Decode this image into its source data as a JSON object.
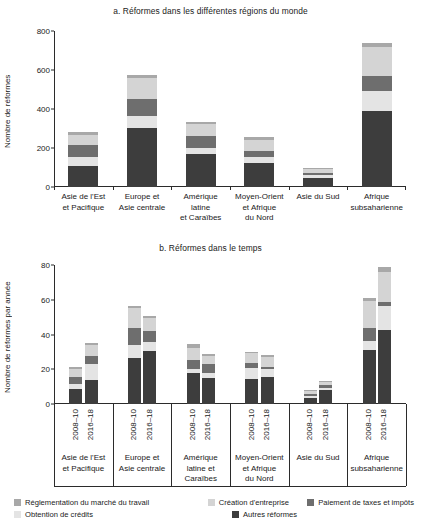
{
  "figure": {
    "panel_a_title": "a. Réformes dans les différentes régions du monde",
    "panel_b_title": "b. Réformes dans le temps",
    "ylabel_a": "Nombre de réformes",
    "ylabel_b": "Nombre de réformes par année"
  },
  "legend": {
    "items": [
      {
        "label": "Réglementation du marché du travail",
        "color": "#a8a8a8"
      },
      {
        "label": "Création d'entreprise",
        "color": "#d4d4d4"
      },
      {
        "label": "Paiement de taxes et impôts",
        "color": "#6e6e6e"
      },
      {
        "label": "Obtention de crédits",
        "color": "#e4e4e4"
      },
      {
        "label": "Autres réformes",
        "color": "#3d3d3d"
      }
    ]
  },
  "chart_data": [
    {
      "type": "bar",
      "id": "panel-a",
      "title": "a. Réformes dans les différentes régions du monde",
      "xlabel": "",
      "ylabel": "Nombre de réformes",
      "ylim": [
        0,
        800
      ],
      "yticks": [
        0,
        200,
        400,
        600,
        800
      ],
      "grid": false,
      "stacked": true,
      "legend_position": "bottom",
      "categories": [
        "Asie de l'Est\net Pacifique",
        "Europe et\nAsie centrale",
        "Amérique\nlatine\net Caraïbes",
        "Moyen-Orient\net Afrique\ndu Nord",
        "Asie du Sud",
        "Afrique\nsubsaharienne"
      ],
      "series": [
        {
          "name": "Autres réformes",
          "color": "#3d3d3d",
          "values": [
            110,
            305,
            167,
            122,
            48,
            390
          ]
        },
        {
          "name": "Obtention de crédits",
          "color": "#e4e4e4",
          "values": [
            45,
            60,
            35,
            32,
            12,
            103
          ]
        },
        {
          "name": "Paiement de taxes et impôts",
          "color": "#6e6e6e",
          "values": [
            63,
            87,
            58,
            30,
            11,
            77
          ]
        },
        {
          "name": "Création d'entreprise",
          "color": "#d4d4d4",
          "values": [
            48,
            106,
            62,
            57,
            20,
            147
          ]
        },
        {
          "name": "Réglementation du marché du travail",
          "color": "#a8a8a8",
          "values": [
            14,
            15,
            11,
            14,
            8,
            23
          ]
        }
      ],
      "totals": [
        280,
        573,
        333,
        255,
        99,
        740
      ]
    },
    {
      "type": "bar",
      "id": "panel-b",
      "title": "b. Réformes dans le temps",
      "xlabel": "",
      "ylabel": "Nombre de réformes par année",
      "ylim": [
        0,
        80
      ],
      "yticks": [
        0,
        20,
        40,
        60,
        80
      ],
      "grid": false,
      "stacked": true,
      "legend_position": "bottom",
      "groups": [
        "Asie de l'Est\net Pacifique",
        "Europe et\nAsie centrale",
        "Amérique\nlatine et\nCaraïbes",
        "Moyen-Orient\net Afrique\ndu Nord",
        "Asie du Sud",
        "Afrique\nsubsaharienne"
      ],
      "periods": [
        "2008–10",
        "2016–18"
      ],
      "categories": [
        "2008–10",
        "2016–18",
        "2008–10",
        "2016–18",
        "2008–10",
        "2016–18",
        "2008–10",
        "2016–18",
        "2008–10",
        "2016–18",
        "2008–10",
        "2016–18"
      ],
      "series": [
        {
          "name": "Autres réformes",
          "color": "#3d3d3d",
          "values": [
            8.5,
            14.0,
            26.3,
            30.8,
            18.0,
            15.0,
            14.5,
            15.8,
            3.2,
            7.8,
            31.0,
            42.7
          ]
        },
        {
          "name": "Obtention de crédits",
          "color": "#e4e4e4",
          "values": [
            3.0,
            8.8,
            7.8,
            4.8,
            2.0,
            3.0,
            6.0,
            4.5,
            1.4,
            1.7,
            5.0,
            13.5
          ]
        },
        {
          "name": "Paiement de taxes et impôts",
          "color": "#6e6e6e",
          "values": [
            4.0,
            4.6,
            9.9,
            6.6,
            5.2,
            5.2,
            3.3,
            1.2,
            1.2,
            1.2,
            8.0,
            2.8
          ]
        },
        {
          "name": "Création d'entreprise",
          "color": "#d4d4d4",
          "values": [
            4.5,
            6.5,
            11.0,
            7.1,
            7.0,
            4.5,
            5.3,
            5.3,
            1.5,
            1.9,
            15.5,
            17.0
          ]
        },
        {
          "name": "Réglementation du marché du travail",
          "color": "#a8a8a8",
          "values": [
            1.2,
            1.2,
            1.6,
            1.6,
            2.2,
            1.2,
            1.0,
            1.2,
            0.7,
            0.8,
            1.5,
            2.8
          ]
        }
      ],
      "totals": [
        21.2,
        35.1,
        56.6,
        50.9,
        34.4,
        28.9,
        30.1,
        28.0,
        8.0,
        13.4,
        61.0,
        78.8
      ]
    }
  ]
}
